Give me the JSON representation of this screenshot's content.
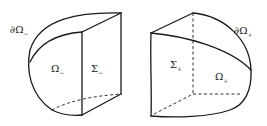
{
  "figure": {
    "left": {
      "boundary_label": "∂Ω",
      "boundary_sub": "−",
      "region_label": "Ω",
      "region_sub": "−",
      "face_label": "Σ",
      "face_sub": "−"
    },
    "right": {
      "boundary_label": "∂Ω",
      "boundary_sub": "+",
      "region_label": "Ω",
      "region_sub": "+",
      "face_label": "Σ",
      "face_sub": "+"
    },
    "colors": {
      "line": "#1a1a1a",
      "background": "#ffffff"
    }
  }
}
